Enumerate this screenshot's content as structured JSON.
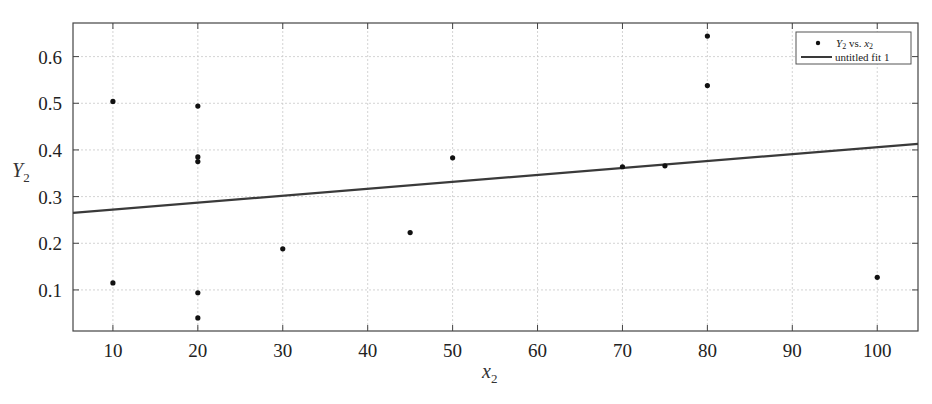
{
  "chart_data": {
    "type": "scatter",
    "title": "",
    "xlabel": "x2",
    "ylabel": "Y2",
    "xlim": [
      5.3,
      104.8
    ],
    "ylim": [
      0.012,
      0.672
    ],
    "grid": true,
    "legend_position": "upper right",
    "x_ticks": [
      10,
      20,
      30,
      40,
      50,
      60,
      70,
      80,
      90,
      100
    ],
    "y_ticks": [
      0.1,
      0.2,
      0.3,
      0.4,
      0.5,
      0.6
    ],
    "x_tick_labels": [
      "10",
      "20",
      "30",
      "40",
      "50",
      "60",
      "70",
      "80",
      "90",
      "100"
    ],
    "y_tick_labels": [
      "0.1",
      "0.2",
      "0.3",
      "0.4",
      "0.5",
      "0.6"
    ],
    "series": [
      {
        "name": "Y2 vs. x2",
        "kind": "scatter",
        "x": [
          10,
          10,
          20,
          20,
          20,
          20,
          20,
          30,
          45,
          50,
          70,
          75,
          80,
          80,
          100
        ],
        "y": [
          0.504,
          0.115,
          0.494,
          0.385,
          0.375,
          0.094,
          0.04,
          0.188,
          0.223,
          0.383,
          0.364,
          0.366,
          0.644,
          0.538,
          0.127
        ]
      },
      {
        "name": "untitled fit 1",
        "kind": "line",
        "x": [
          5.3,
          104.8
        ],
        "y": [
          0.265,
          0.413
        ]
      }
    ]
  },
  "legend": {
    "scatter_label_main": "Y",
    "scatter_label_sub": "2",
    "scatter_label_vs": " vs. ",
    "scatter_label_x": "x",
    "scatter_label_xsub": "2",
    "fit_label": "untitled fit 1"
  },
  "axes": {
    "x_label_main": "x",
    "x_label_sub": "2",
    "y_label_main": "Y",
    "y_label_sub": "2"
  },
  "colors": {
    "marker": "#111111",
    "fit_line": "#3a3a3a",
    "grid": "#c8c8c8",
    "axis": "#444444"
  }
}
